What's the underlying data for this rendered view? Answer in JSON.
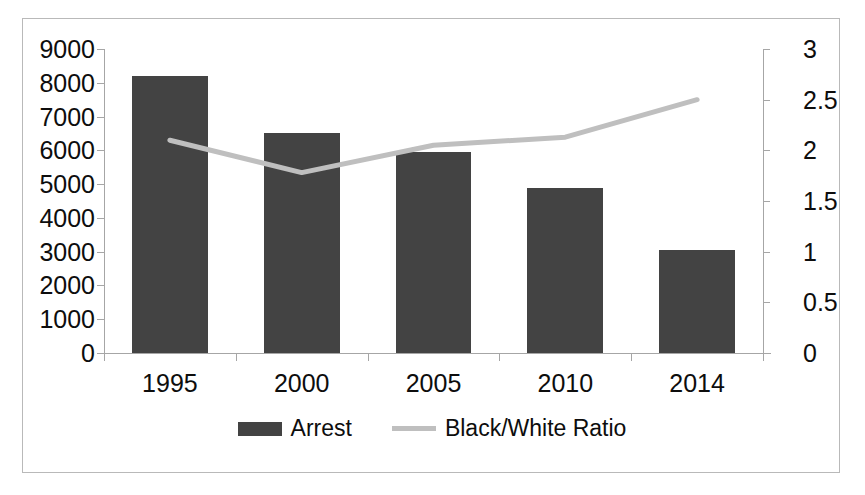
{
  "chart_data": {
    "type": "bar",
    "title": "",
    "categories": [
      "1995",
      "2000",
      "2005",
      "2010",
      "2014"
    ],
    "series": [
      {
        "name": "Arrest",
        "type": "bar",
        "axis": "left",
        "color": "#434343",
        "values": [
          8200,
          6500,
          5950,
          4900,
          3050
        ]
      },
      {
        "name": "Black/White Ratio",
        "type": "line",
        "axis": "right",
        "color": "#bfbfbf",
        "values": [
          2.1,
          1.78,
          2.05,
          2.13,
          2.5
        ]
      }
    ],
    "xlabel": "",
    "ylabel": "",
    "ylim": [
      0,
      9000
    ],
    "y2lim": [
      0,
      3
    ],
    "yticks": [
      "9000",
      "8000",
      "7000",
      "6000",
      "5000",
      "4000",
      "3000",
      "2000",
      "1000",
      "0"
    ],
    "y2ticks": [
      "3",
      "2.5",
      "2",
      "1.5",
      "1",
      "0.5",
      "0"
    ],
    "grid": false,
    "legend_position": "bottom"
  },
  "legend": {
    "items": [
      {
        "label": "Arrest",
        "marker": "bar-swatch",
        "color": "#434343"
      },
      {
        "label": "Black/White Ratio",
        "marker": "line-swatch",
        "color": "#bfbfbf"
      }
    ]
  },
  "frame": {
    "border_color": "#b9b9b9",
    "background": "#ffffff"
  }
}
